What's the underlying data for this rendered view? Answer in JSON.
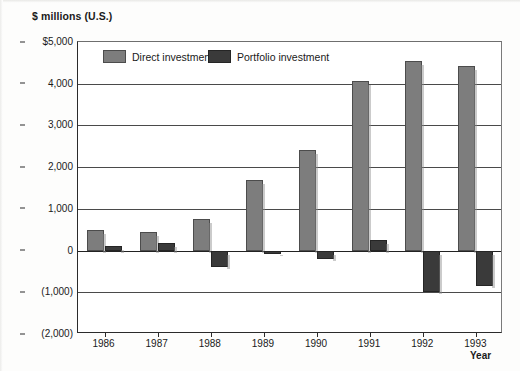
{
  "chart_data": {
    "type": "bar",
    "title": "",
    "ylabel": "$ millions (U.S.)",
    "xlabel": "Year",
    "categories": [
      "1986",
      "1987",
      "1988",
      "1989",
      "1990",
      "1991",
      "1992",
      "1993"
    ],
    "series": [
      {
        "name": "Direct investment",
        "color": "#7d7d7d",
        "values": [
          500,
          450,
          750,
          1700,
          2400,
          4070,
          4550,
          4430
        ]
      },
      {
        "name": "Portfolio investment",
        "color": "#3a3a3a",
        "values": [
          100,
          175,
          -400,
          -80,
          -200,
          250,
          -1000,
          -850
        ]
      }
    ],
    "ylim": [
      -2000,
      5000
    ],
    "ytick_values": [
      5000,
      4000,
      3000,
      2000,
      1000,
      0,
      -1000,
      -2000
    ],
    "ytick_labels": [
      "$5,000",
      "4,000",
      "3,000",
      "2,000",
      "1,000",
      "0",
      "(1,000)",
      "(2,000)"
    ],
    "grid": true,
    "legend_position": "top-inside-left"
  },
  "legend": {
    "items": [
      {
        "label": "Direct investment",
        "swatch": "direct-swatch"
      },
      {
        "label": "Portfolio investment",
        "swatch": "portfolio-swatch"
      }
    ]
  }
}
